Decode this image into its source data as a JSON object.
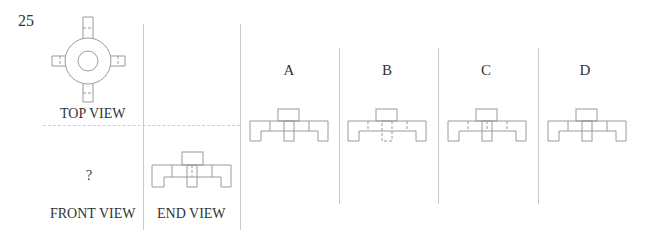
{
  "question": {
    "number": "25"
  },
  "views": {
    "top_view_label": "TOP VIEW",
    "front_view_label": "FRONT VIEW",
    "front_view_value": "?",
    "end_view_label": "END VIEW"
  },
  "options": [
    {
      "letter": "A",
      "hidden_lines": "none"
    },
    {
      "letter": "B",
      "hidden_lines": "dashed-outer-dividers"
    },
    {
      "letter": "C",
      "hidden_lines": "dashed-left-right-dividers"
    },
    {
      "letter": "D",
      "hidden_lines": "none-solid-center"
    }
  ],
  "colors": {
    "line": "#9a9a9a",
    "divider": "#c8c8c8",
    "text": "#333333"
  }
}
